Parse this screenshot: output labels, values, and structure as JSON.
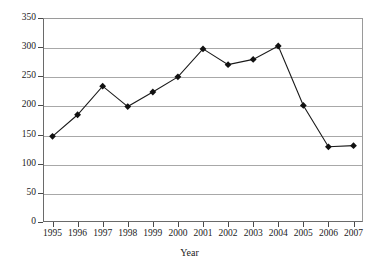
{
  "chart_data": {
    "type": "line",
    "title": "",
    "xlabel": "Year",
    "ylabel": "",
    "categories": [
      "1995",
      "1996",
      "1997",
      "1998",
      "1999",
      "2000",
      "2001",
      "2002",
      "2003",
      "2004",
      "2005",
      "2006",
      "2007"
    ],
    "values": [
      147,
      184,
      233,
      198,
      223,
      249,
      297,
      270,
      279,
      302,
      200,
      129,
      131
    ],
    "series": [
      {
        "name": "",
        "values": [
          147,
          184,
          233,
          198,
          223,
          249,
          297,
          270,
          279,
          302,
          200,
          129,
          131
        ]
      }
    ],
    "ylim": [
      0,
      350
    ],
    "ytick_values": [
      0,
      50,
      100,
      150,
      200,
      250,
      300,
      350
    ],
    "ytick_labels": [
      "0",
      "50",
      "100",
      "150",
      "200",
      "250",
      "300",
      "350"
    ],
    "xtick_labels": [
      "1995",
      "1996",
      "1997",
      "1998",
      "1999",
      "2000",
      "2001",
      "2002",
      "2003",
      "2004",
      "2005",
      "2006",
      "2007"
    ],
    "grid": true,
    "legend": false,
    "legend_position": "none",
    "marker": "diamond",
    "colors": {
      "line": "#1a1a1a",
      "marker": "#111111",
      "grid": "#a8a8a8",
      "axis": "#4a4a4a",
      "background": "#ffffff"
    }
  }
}
